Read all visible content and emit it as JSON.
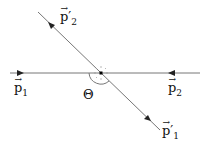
{
  "diagram": {
    "labels": {
      "p2_prime": {
        "base": "p",
        "sub": "2",
        "prime": "′"
      },
      "p1": {
        "base": "p",
        "sub": "1"
      },
      "p2": {
        "base": "p",
        "sub": "2"
      },
      "p1_prime": {
        "base": "p",
        "sub": "1",
        "prime": "′"
      },
      "theta": "Θ"
    },
    "arrow_glyph": "→",
    "colors": {
      "line": "#777777",
      "text": "#111111",
      "dot": "#000000"
    }
  }
}
